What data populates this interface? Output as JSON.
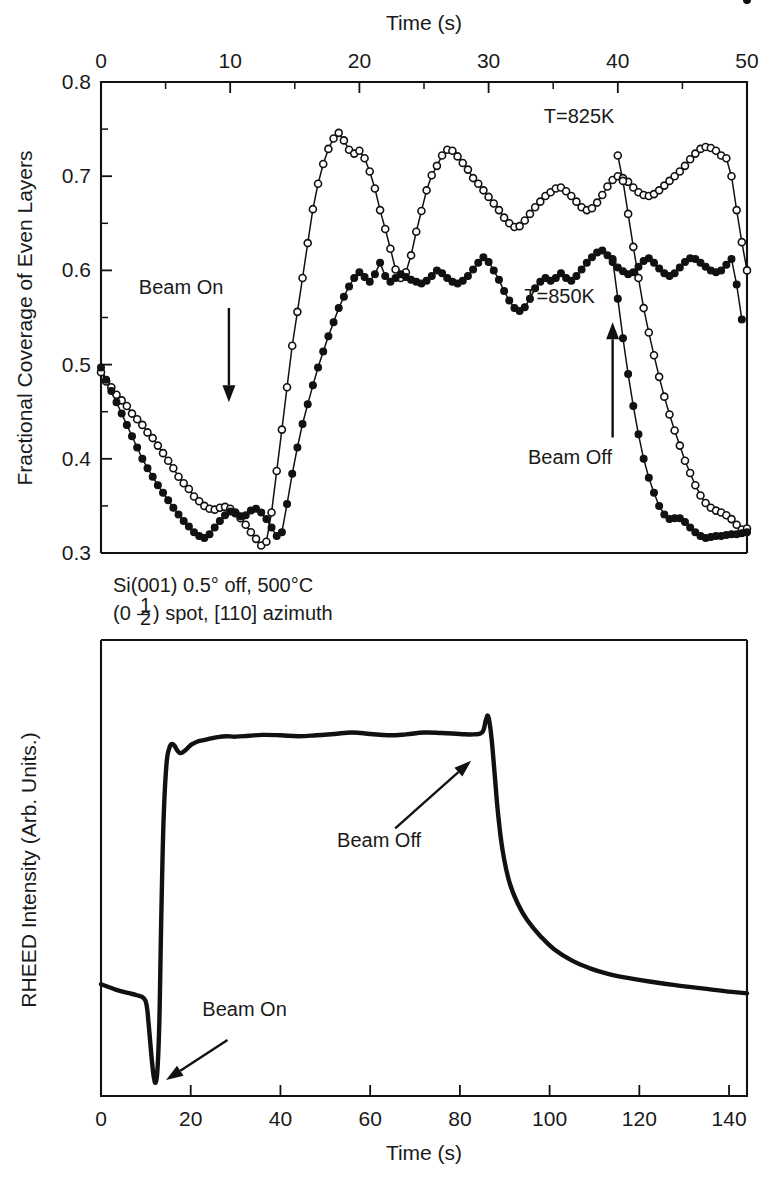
{
  "figure": {
    "title_top_axis": "Time (s)",
    "title_bottom_axis": "Time (s)"
  },
  "upper_panel": {
    "ylabel": "Fractional Coverage of Even Layers",
    "xlabel": "Time (s)",
    "xlabel_position": "top",
    "x_ticklabels": [
      "0",
      "10",
      "20",
      "30",
      "40",
      "50"
    ],
    "y_ticklabels": [
      "0.8",
      "0.7",
      "0.6",
      "0.5",
      "0.4",
      "0.3"
    ],
    "annotations": {
      "beam_on": "Beam On",
      "beam_off": "Beam Off",
      "series_825": "T=825K",
      "series_850": "T=850K"
    }
  },
  "lower_panel": {
    "ylabel": "RHEED Intensity (Arb. Units.)",
    "xlabel": "Time (s)",
    "x_ticklabels": [
      "0",
      "20",
      "40",
      "60",
      "80",
      "100",
      "120",
      "140"
    ],
    "annotations": {
      "beam_on": "Beam On",
      "beam_off": "Beam Off",
      "sample_line1": "Si(001) 0.5° off, 500°C",
      "sample_line2_prefix": "(0",
      "sample_line2_frac_num": "1",
      "sample_line2_frac_den": "2",
      "sample_line2_suffix": ") spot, [110] azimuth"
    }
  },
  "colors": {
    "ink": "#111111",
    "background": "#ffffff"
  },
  "chart_data": [
    {
      "type": "line",
      "id": "upper-coverage",
      "title": "",
      "xlabel": "Time (s)",
      "ylabel": "Fractional Coverage of Even Layers",
      "xlim": [
        0,
        50
      ],
      "ylim": [
        0.3,
        0.8
      ],
      "xticks": [
        0,
        10,
        20,
        30,
        40,
        50
      ],
      "yticks": [
        0.3,
        0.4,
        0.5,
        0.6,
        0.7,
        0.8
      ],
      "xticks_minor": [
        5,
        15,
        25,
        35,
        45
      ],
      "yticks_minor": [
        0.35,
        0.45,
        0.55,
        0.65,
        0.75
      ],
      "grid": false,
      "legend": "inline-annotations",
      "annotations": [
        {
          "text": "Beam On",
          "x": 6.2,
          "y": 0.575,
          "arrow_to": {
            "x": 9.9,
            "y": 0.46
          }
        },
        {
          "text": "Beam Off",
          "x": 36.3,
          "y": 0.395,
          "arrow_to": {
            "x": 39.6,
            "y": 0.545
          }
        },
        {
          "text": "T=825K",
          "x": 37.0,
          "y": 0.757
        },
        {
          "text": "T=850K",
          "x": 35.5,
          "y": 0.565
        }
      ],
      "series": [
        {
          "name": "T=825K",
          "marker": "open-circle",
          "x": [
            0.0,
            0.4,
            0.8,
            1.2,
            1.6,
            2.0,
            2.4,
            2.8,
            3.2,
            3.6,
            4.0,
            4.4,
            4.8,
            5.2,
            5.6,
            6.0,
            6.4,
            6.8,
            7.2,
            7.6,
            8.0,
            8.4,
            8.8,
            9.2,
            9.6,
            10.0,
            10.4,
            10.8,
            11.2,
            11.6,
            12.0,
            12.4,
            12.8,
            13.2,
            13.6,
            14.0,
            14.4,
            14.8,
            15.2,
            15.6,
            16.0,
            16.4,
            16.8,
            17.2,
            17.6,
            18.0,
            18.4,
            18.8,
            19.2,
            19.6,
            20.0,
            20.4,
            20.8,
            21.2,
            21.6,
            22.0,
            22.4,
            22.8,
            23.2,
            23.6,
            24.0,
            24.4,
            24.8,
            25.2,
            25.6,
            26.0,
            26.4,
            26.8,
            27.2,
            27.6,
            28.0,
            28.4,
            28.8,
            29.2,
            29.6,
            30.0,
            30.4,
            30.8,
            31.2,
            31.6,
            32.0,
            32.4,
            32.8,
            33.2,
            33.6,
            34.0,
            34.4,
            34.8,
            35.2,
            35.6,
            36.0,
            36.4,
            36.8,
            37.2,
            37.6,
            38.0,
            38.4,
            38.8,
            39.2,
            39.6,
            40.0,
            40.4,
            40.8,
            41.2,
            41.6,
            42.0,
            42.4,
            42.8,
            43.2,
            43.6,
            44.0,
            44.4,
            44.8,
            45.2,
            45.6,
            46.0,
            46.4,
            46.8,
            47.2,
            47.6,
            48.0,
            48.4,
            48.8,
            49.2,
            49.6,
            50.0
          ],
          "y": [
            0.492,
            0.482,
            0.476,
            0.468,
            0.462,
            0.456,
            0.448,
            0.442,
            0.436,
            0.428,
            0.422,
            0.414,
            0.406,
            0.398,
            0.39,
            0.381,
            0.374,
            0.368,
            0.36,
            0.355,
            0.35,
            0.347,
            0.346,
            0.348,
            0.349,
            0.347,
            0.343,
            0.337,
            0.33,
            0.322,
            0.315,
            0.308,
            0.312,
            0.343,
            0.387,
            0.431,
            0.476,
            0.52,
            0.556,
            0.592,
            0.629,
            0.665,
            0.692,
            0.713,
            0.729,
            0.74,
            0.746,
            0.738,
            0.728,
            0.724,
            0.727,
            0.719,
            0.705,
            0.687,
            0.664,
            0.644,
            0.623,
            0.601,
            0.592,
            0.598,
            0.616,
            0.641,
            0.663,
            0.685,
            0.701,
            0.711,
            0.722,
            0.728,
            0.727,
            0.721,
            0.714,
            0.707,
            0.698,
            0.692,
            0.685,
            0.678,
            0.671,
            0.664,
            0.656,
            0.65,
            0.646,
            0.647,
            0.653,
            0.66,
            0.667,
            0.673,
            0.679,
            0.683,
            0.687,
            0.688,
            0.684,
            0.679,
            0.673,
            0.667,
            0.664,
            0.666,
            0.672,
            0.68,
            0.689,
            0.696,
            0.7,
            0.698,
            0.694,
            0.688,
            0.683,
            0.68,
            0.679,
            0.681,
            0.685,
            0.69,
            0.695,
            0.7,
            0.705,
            0.711,
            0.718,
            0.724,
            0.729,
            0.731,
            0.73,
            0.727,
            0.722,
            0.719,
            0.7,
            0.664,
            0.63,
            0.6
          ]
        },
        {
          "name": "T=825K-tail",
          "marker": "open-circle",
          "x": [
            40.0,
            40.4,
            40.8,
            41.2,
            41.6,
            42.0,
            42.4,
            42.8,
            43.2,
            43.6,
            44.0,
            44.4,
            44.8,
            45.2,
            45.6,
            46.0,
            46.4,
            46.8,
            47.2,
            47.6,
            48.0,
            48.4,
            48.8,
            49.2,
            49.6,
            50.0
          ],
          "y": [
            0.722,
            0.695,
            0.66,
            0.625,
            0.592,
            0.56,
            0.534,
            0.51,
            0.487,
            0.466,
            0.447,
            0.43,
            0.414,
            0.398,
            0.385,
            0.372,
            0.361,
            0.353,
            0.348,
            0.345,
            0.343,
            0.34,
            0.336,
            0.33,
            0.325,
            0.326
          ]
        },
        {
          "name": "T=850K",
          "marker": "filled-circle",
          "x": [
            0.0,
            0.4,
            0.8,
            1.2,
            1.6,
            2.0,
            2.4,
            2.8,
            3.2,
            3.6,
            4.0,
            4.4,
            4.8,
            5.2,
            5.6,
            6.0,
            6.4,
            6.8,
            7.2,
            7.6,
            8.0,
            8.4,
            8.8,
            9.2,
            9.6,
            10.0,
            10.4,
            10.8,
            11.2,
            11.6,
            12.0,
            12.4,
            12.8,
            13.2,
            13.6,
            14.0,
            14.4,
            14.8,
            15.2,
            15.6,
            16.0,
            16.4,
            16.8,
            17.2,
            17.6,
            18.0,
            18.4,
            18.8,
            19.2,
            19.6,
            20.0,
            20.4,
            20.8,
            21.2,
            21.6,
            22.0,
            22.4,
            22.8,
            23.2,
            23.6,
            24.0,
            24.4,
            24.8,
            25.2,
            25.6,
            26.0,
            26.4,
            26.8,
            27.2,
            27.6,
            28.0,
            28.4,
            28.8,
            29.2,
            29.6,
            30.0,
            30.4,
            30.8,
            31.2,
            31.6,
            32.0,
            32.4,
            32.8,
            33.2,
            33.6,
            34.0,
            34.4,
            34.8,
            35.2,
            35.6,
            36.0,
            36.4,
            36.8,
            37.2,
            37.6,
            38.0,
            38.4,
            38.8,
            39.2,
            39.6,
            40.0,
            40.4,
            40.8,
            41.2,
            41.6,
            42.0,
            42.4,
            42.8,
            43.2,
            43.6,
            44.0,
            44.4,
            44.8,
            45.2,
            45.6,
            46.0,
            46.4,
            46.8,
            47.2,
            47.6,
            48.0,
            48.4,
            48.8,
            49.2,
            49.6,
            50.0
          ],
          "y": [
            0.497,
            0.484,
            0.472,
            0.46,
            0.448,
            0.436,
            0.424,
            0.412,
            0.4,
            0.39,
            0.381,
            0.372,
            0.364,
            0.356,
            0.348,
            0.341,
            0.334,
            0.328,
            0.322,
            0.318,
            0.316,
            0.32,
            0.327,
            0.334,
            0.34,
            0.344,
            0.342,
            0.339,
            0.34,
            0.345,
            0.347,
            0.343,
            0.336,
            0.327,
            0.318,
            0.322,
            0.352,
            0.384,
            0.412,
            0.437,
            0.458,
            0.478,
            0.497,
            0.514,
            0.53,
            0.545,
            0.56,
            0.572,
            0.583,
            0.592,
            0.598,
            0.593,
            0.588,
            0.596,
            0.608,
            0.594,
            0.588,
            0.592,
            0.596,
            0.593,
            0.59,
            0.588,
            0.586,
            0.589,
            0.594,
            0.6,
            0.597,
            0.592,
            0.588,
            0.586,
            0.589,
            0.594,
            0.601,
            0.608,
            0.614,
            0.609,
            0.6,
            0.59,
            0.578,
            0.568,
            0.56,
            0.557,
            0.561,
            0.57,
            0.581,
            0.588,
            0.592,
            0.589,
            0.592,
            0.597,
            0.592,
            0.589,
            0.594,
            0.601,
            0.608,
            0.614,
            0.619,
            0.621,
            0.616,
            0.609,
            0.603,
            0.599,
            0.596,
            0.598,
            0.604,
            0.61,
            0.613,
            0.608,
            0.602,
            0.597,
            0.594,
            0.597,
            0.603,
            0.609,
            0.613,
            0.612,
            0.608,
            0.604,
            0.6,
            0.598,
            0.6,
            0.606,
            0.612,
            0.585,
            0.548
          ]
        },
        {
          "name": "T=850K-tail",
          "marker": "filled-circle",
          "x": [
            39.6,
            40.0,
            40.4,
            40.8,
            41.2,
            41.6,
            42.0,
            42.4,
            42.8,
            43.2,
            43.6,
            44.0,
            44.4,
            44.8,
            45.2,
            45.6,
            46.0,
            46.4,
            46.8,
            47.2,
            47.6,
            48.0,
            48.4,
            48.8,
            49.2,
            49.6,
            50.0
          ],
          "y": [
            0.612,
            0.57,
            0.528,
            0.49,
            0.456,
            0.426,
            0.4,
            0.38,
            0.364,
            0.35,
            0.341,
            0.336,
            0.337,
            0.337,
            0.333,
            0.327,
            0.322,
            0.318,
            0.316,
            0.317,
            0.318,
            0.318,
            0.319,
            0.32,
            0.32,
            0.321,
            0.322
          ]
        }
      ]
    },
    {
      "type": "line",
      "id": "lower-rheed",
      "title": "",
      "xlabel": "Time (s)",
      "ylabel": "RHEED Intensity (Arb. Units.)",
      "xlim": [
        0,
        144
      ],
      "ylim": [
        0,
        1
      ],
      "xticks": [
        0,
        20,
        40,
        60,
        80,
        100,
        120,
        140
      ],
      "yticks": [],
      "grid": false,
      "annotations": [
        {
          "text": "Beam On",
          "x": 32,
          "y": 0.175,
          "arrow_to": {
            "x": 14.5,
            "y": 0.035
          }
        },
        {
          "text": "Beam Off",
          "x": 62,
          "y": 0.545,
          "arrow_to": {
            "x": 82.5,
            "y": 0.735
          }
        }
      ],
      "series": [
        {
          "name": "RHEED (0 1/2) spot intensity",
          "marker": "none",
          "x": [
            0,
            2,
            4,
            6,
            8,
            9.6,
            10.2,
            10.6,
            11.0,
            11.4,
            11.8,
            12.2,
            12.6,
            13.0,
            13.3,
            13.6,
            14.0,
            14.6,
            15.2,
            15.8,
            16.4,
            17.0,
            17.6,
            18.4,
            19.2,
            20.2,
            21.4,
            22.6,
            24.0,
            26.0,
            28.0,
            30.0,
            33.0,
            36.0,
            40.0,
            44.0,
            48.0,
            52.0,
            56.0,
            60.0,
            64.0,
            68.0,
            72.0,
            76.0,
            80.0,
            83.0,
            85.0,
            85.8,
            86.3,
            86.8,
            87.2,
            87.8,
            88.5,
            89.5,
            91.0,
            93.0,
            95.0,
            98.0,
            101.0,
            105.0,
            109.0,
            113.0,
            118.0,
            123.0,
            128.0,
            134.0,
            139.0,
            144.0
          ],
          "y": [
            0.245,
            0.238,
            0.231,
            0.226,
            0.221,
            0.214,
            0.197,
            0.16,
            0.115,
            0.072,
            0.04,
            0.03,
            0.06,
            0.16,
            0.32,
            0.47,
            0.62,
            0.728,
            0.762,
            0.772,
            0.768,
            0.758,
            0.752,
            0.755,
            0.762,
            0.771,
            0.777,
            0.78,
            0.783,
            0.787,
            0.789,
            0.788,
            0.79,
            0.792,
            0.791,
            0.789,
            0.791,
            0.794,
            0.797,
            0.794,
            0.791,
            0.793,
            0.797,
            0.796,
            0.794,
            0.793,
            0.798,
            0.825,
            0.833,
            0.806,
            0.77,
            0.7,
            0.62,
            0.54,
            0.47,
            0.42,
            0.386,
            0.35,
            0.322,
            0.297,
            0.28,
            0.268,
            0.258,
            0.25,
            0.243,
            0.236,
            0.23,
            0.225
          ]
        }
      ]
    }
  ]
}
